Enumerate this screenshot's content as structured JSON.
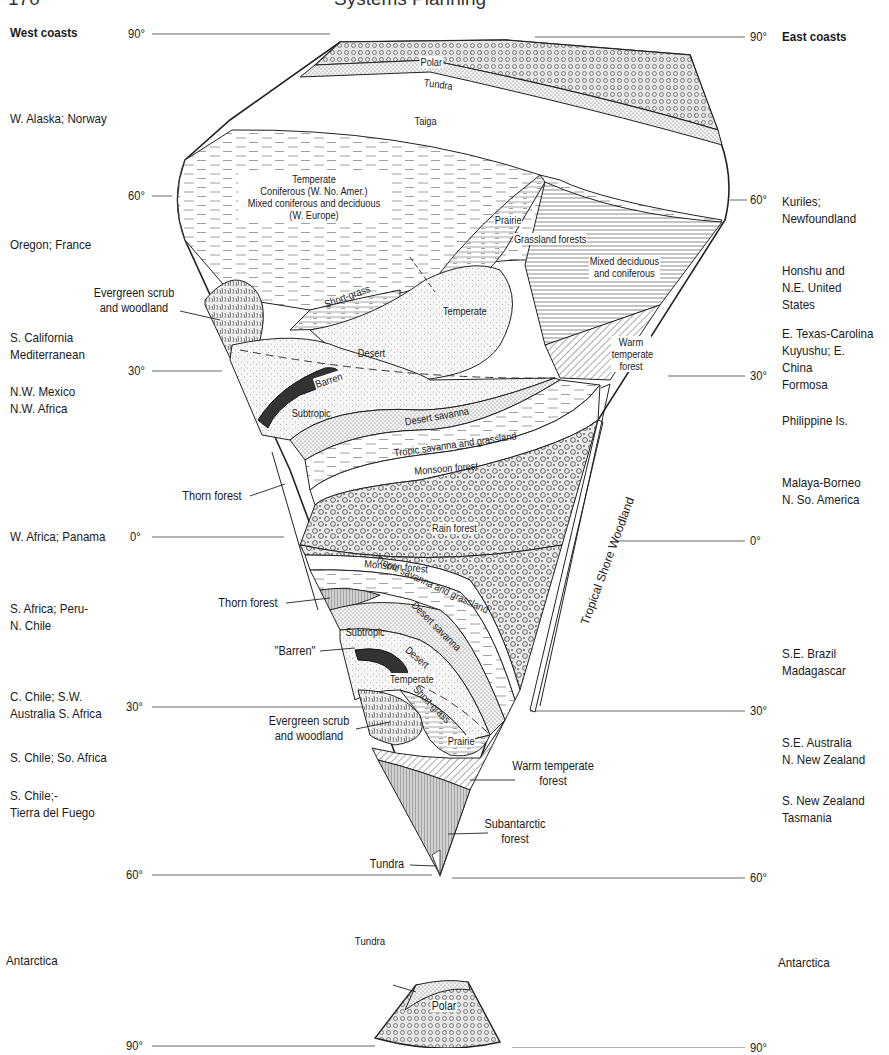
{
  "header": {
    "page_number_fragment": "170",
    "running_title": "Systems Planning"
  },
  "figure": {
    "column_headers": {
      "left": "West coasts",
      "right": "East coasts"
    },
    "latitude_ticks": {
      "left": [
        {
          "label": "90°",
          "y": 34
        },
        {
          "label": "60°",
          "y": 196
        },
        {
          "label": "30°",
          "y": 371
        },
        {
          "label": "0°",
          "y": 537
        },
        {
          "label": "30°",
          "y": 707
        },
        {
          "label": "60°",
          "y": 875
        },
        {
          "label": "90°",
          "y": 1046
        }
      ],
      "right": [
        {
          "label": "90°",
          "y": 37
        },
        {
          "label": "60°",
          "y": 200
        },
        {
          "label": "30°",
          "y": 376
        },
        {
          "label": "0°",
          "y": 541
        },
        {
          "label": "30°",
          "y": 711
        },
        {
          "label": "60°",
          "y": 878
        },
        {
          "label": "90°",
          "y": 1048
        }
      ]
    },
    "west_regions": [
      {
        "label": "W. Alaska; Norway",
        "y": 118
      },
      {
        "label": "Oregon; France",
        "y": 243
      },
      {
        "label": "S. California\nMediterranean",
        "y": 337
      },
      {
        "label": "N.W. Mexico\nN.W. Africa",
        "y": 391
      },
      {
        "label": "W. Africa; Panama",
        "y": 530
      },
      {
        "label": "S. Africa; Peru-\nN. Chile",
        "y": 605
      },
      {
        "label": "C. Chile; S.W.\nAustralia S. Africa",
        "y": 695
      },
      {
        "label": "S. Chile; So. Africa",
        "y": 750
      },
      {
        "label": "S. Chile;-\nTierra del Fuego",
        "y": 790
      },
      {
        "label": "Antarctica",
        "y": 955
      }
    ],
    "east_regions": [
      {
        "label": "Kuriles;\nNewfoundland",
        "y": 200
      },
      {
        "label": "Honshu and\nN.E. United States",
        "y": 269
      },
      {
        "label": "E. Texas-Carolina\nKuyushu; E. China\nFormosa",
        "y": 332
      },
      {
        "label": "Philippine Is.",
        "y": 413
      },
      {
        "label": "Malaya-Borneo\nN. So. America",
        "y": 475
      },
      {
        "label": "S.E. Brazil\nMadagascar",
        "y": 646
      },
      {
        "label": "S.E. Australia\nN. New Zealand",
        "y": 735
      },
      {
        "label": "S. New Zealand\nTasmania",
        "y": 793
      },
      {
        "label": "Antarctica",
        "y": 957
      }
    ],
    "zones_north": [
      {
        "label": "Polar"
      },
      {
        "label": "Tundra"
      },
      {
        "label": "Taiga"
      },
      {
        "label": "Temperate\nConiferous (W. No. Amer.)\nMixed coniferous and deciduous\n(W. Europe)"
      },
      {
        "label": "Prairie"
      },
      {
        "label": "Grassland forests"
      },
      {
        "label": "Mixed deciduous\nand coniferous"
      },
      {
        "label": "Short-grass"
      },
      {
        "label": "Temperate"
      },
      {
        "label": "Desert"
      },
      {
        "label": "Barren"
      },
      {
        "label": "Subtropic"
      },
      {
        "label": "Warm\ntemperate\nforest"
      },
      {
        "label": "Desert savanna"
      },
      {
        "label": "Tropic savanna and grassland"
      },
      {
        "label": "Monsoon forest"
      },
      {
        "label": "Rain forest"
      },
      {
        "label": "Tropical Shore Woodland"
      }
    ],
    "zones_south": [
      {
        "label": "Monsoon forest"
      },
      {
        "label": "Tropic savanna and grassland"
      },
      {
        "label": "Desert savanna"
      },
      {
        "label": "Subtropic"
      },
      {
        "label": "Desert"
      },
      {
        "label": "Temperate"
      },
      {
        "label": "Short-grass"
      },
      {
        "label": "Prairie"
      }
    ],
    "callouts": [
      {
        "label": "Evergreen scrub\nand woodland"
      },
      {
        "label": "Thorn forest"
      },
      {
        "label": "Thorn forest"
      },
      {
        "label": "\"Barren\""
      },
      {
        "label": "Evergreen scrub\nand woodland"
      },
      {
        "label": "Warm temperate\nforest"
      },
      {
        "label": "Subantarctic\nforest"
      },
      {
        "label": "Tundra"
      },
      {
        "label": "Tundra"
      },
      {
        "label": "Polar"
      }
    ]
  }
}
